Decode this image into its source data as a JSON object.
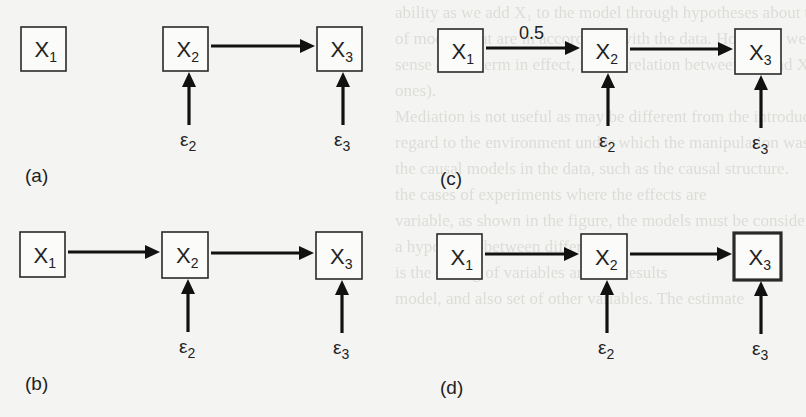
{
  "figure": {
    "type": "causal-path-diagrams",
    "panels": [
      {
        "id": "a",
        "label": "(a)",
        "nodes": [
          {
            "id": "X1",
            "base": "X",
            "sub": "1",
            "x": 21,
            "y": 27,
            "w": 45,
            "h": 44,
            "thick": false
          },
          {
            "id": "X2",
            "base": "X",
            "sub": "2",
            "x": 163,
            "y": 27,
            "w": 45,
            "h": 44,
            "thick": false
          },
          {
            "id": "X3",
            "base": "X",
            "sub": "3",
            "x": 317,
            "y": 27,
            "w": 45,
            "h": 44,
            "thick": false
          }
        ],
        "edges": [
          {
            "from": "X2",
            "to": "X3",
            "label": ""
          }
        ],
        "errors": [
          {
            "id": "e2",
            "symbol": "ε",
            "sub": "2",
            "target": "X2"
          },
          {
            "id": "e3",
            "symbol": "ε",
            "sub": "3",
            "target": "X3"
          }
        ],
        "label_pos": {
          "x": 25,
          "y": 182
        }
      },
      {
        "id": "b",
        "label": "(b)",
        "nodes": [
          {
            "id": "X1",
            "base": "X",
            "sub": "1",
            "x": 20,
            "y": 232,
            "w": 45,
            "h": 45,
            "thick": false
          },
          {
            "id": "X2",
            "base": "X",
            "sub": "2",
            "x": 162,
            "y": 232,
            "w": 46,
            "h": 46,
            "thick": false
          },
          {
            "id": "X3",
            "base": "X",
            "sub": "3",
            "x": 316,
            "y": 232,
            "w": 46,
            "h": 47,
            "thick": false
          }
        ],
        "edges": [
          {
            "from": "X1",
            "to": "X2",
            "label": ""
          },
          {
            "from": "X2",
            "to": "X3",
            "label": ""
          }
        ],
        "errors": [
          {
            "id": "e2",
            "symbol": "ε",
            "sub": "2",
            "target": "X2"
          },
          {
            "id": "e3",
            "symbol": "ε",
            "sub": "3",
            "target": "X3"
          }
        ],
        "label_pos": {
          "x": 25,
          "y": 390
        }
      },
      {
        "id": "c",
        "label": "(c)",
        "nodes": [
          {
            "id": "X1",
            "base": "X",
            "sub": "1",
            "x": 438,
            "y": 29,
            "w": 45,
            "h": 43,
            "thick": false
          },
          {
            "id": "X2",
            "base": "X",
            "sub": "2",
            "x": 582,
            "y": 29,
            "w": 45,
            "h": 43,
            "thick": false
          },
          {
            "id": "X3",
            "base": "X",
            "sub": "3",
            "x": 735,
            "y": 29,
            "w": 46,
            "h": 45,
            "thick": false
          }
        ],
        "edges": [
          {
            "from": "X1",
            "to": "X2",
            "label": "0.5"
          },
          {
            "from": "X2",
            "to": "X3",
            "label": ""
          }
        ],
        "errors": [
          {
            "id": "e2",
            "symbol": "ε",
            "sub": "2",
            "target": "X2"
          },
          {
            "id": "e3",
            "symbol": "ε",
            "sub": "3",
            "target": "X3"
          }
        ],
        "label_pos": {
          "x": 440,
          "y": 185
        }
      },
      {
        "id": "d",
        "label": "(d)",
        "nodes": [
          {
            "id": "X1",
            "base": "X",
            "sub": "1",
            "x": 437,
            "y": 234,
            "w": 45,
            "h": 45,
            "thick": false
          },
          {
            "id": "X2",
            "base": "X",
            "sub": "2",
            "x": 581,
            "y": 234,
            "w": 46,
            "h": 45,
            "thick": false
          },
          {
            "id": "X3",
            "base": "X",
            "sub": "3",
            "x": 734,
            "y": 233,
            "w": 47,
            "h": 47,
            "thick": true
          }
        ],
        "edges": [
          {
            "from": "X1",
            "to": "X2",
            "label": ""
          },
          {
            "from": "X2",
            "to": "X3",
            "label": ""
          }
        ],
        "errors": [
          {
            "id": "e2",
            "symbol": "ε",
            "sub": "2",
            "target": "X2"
          },
          {
            "id": "e3",
            "symbol": "ε",
            "sub": "3",
            "target": "X3"
          }
        ],
        "label_pos": {
          "x": 440,
          "y": 394
        }
      }
    ]
  },
  "background_text_lines": [
    "ability as we add X₁ to the model through hypotheses about the",
    "of models that are in accordance with the data. However, we will",
    "sense of the term in effect, for the relation between X₂ and X₃ in all",
    "ones).",
    "Mediation is not useful as may be different from the introduction of",
    "regard to the environment under which the manipulation was",
    "the causal models in the data, such as the causal structure.",
    "the cases of experiments where the effects are",
    "variable, as shown in the figure, the models must be considered",
    "a hypothesis between different",
    "is the setting of variables and the results",
    "model, and also set of other variables. The estimate"
  ]
}
